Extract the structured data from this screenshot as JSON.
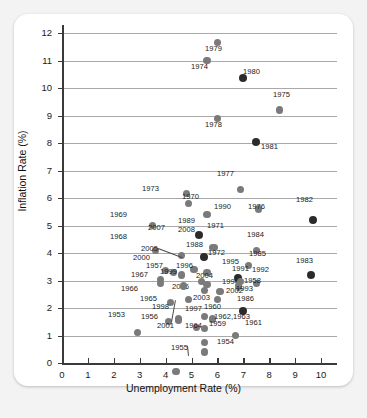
{
  "chart_data": {
    "type": "scatter",
    "title": "",
    "xlabel": "Unemployment Rate (%)",
    "ylabel": "Inflation Rate (%)",
    "xlim": [
      0,
      10.5
    ],
    "ylim": [
      0,
      12.3
    ],
    "xticks": [
      "0",
      "1",
      "2",
      "3",
      "4",
      "5",
      "6",
      "7",
      "8",
      "9",
      "10"
    ],
    "yticks": [
      "0",
      "1",
      "2",
      "3",
      "4",
      "5",
      "6",
      "7",
      "8",
      "9",
      "10",
      "11",
      "12"
    ],
    "grid": "horizontal",
    "legend": "none",
    "point_color": "#7a7a7a",
    "point_color_dark": "#2b2b2b",
    "points": [
      {
        "label": "1979",
        "x": 6.0,
        "y": 11.65,
        "lx": 205,
        "ly": 45,
        "dark": false
      },
      {
        "label": "1974",
        "x": 5.6,
        "y": 11.0,
        "lx": 191,
        "ly": 63,
        "dark": false
      },
      {
        "label": "1980",
        "x": 7.0,
        "y": 10.35,
        "lx": 243,
        "ly": 68,
        "dark": true
      },
      {
        "label": "1975",
        "x": 8.4,
        "y": 9.2,
        "lx": 273,
        "ly": 91,
        "dark": false
      },
      {
        "label": "1978",
        "x": 6.0,
        "y": 8.9,
        "lx": 205,
        "ly": 121,
        "dark": false
      },
      {
        "label": "1981",
        "x": 7.5,
        "y": 8.05,
        "lx": 261,
        "ly": 143,
        "dark": true
      },
      {
        "label": "1977",
        "x": 6.9,
        "y": 6.3,
        "lx": 217,
        "ly": 170,
        "dark": false
      },
      {
        "label": "1973",
        "x": 4.8,
        "y": 6.15,
        "lx": 142,
        "ly": 185,
        "dark": false
      },
      {
        "label": "1970",
        "x": 4.9,
        "y": 5.8,
        "lx": 182,
        "ly": 193,
        "dark": false
      },
      {
        "label": "1990",
        "x": 5.6,
        "y": 5.4,
        "lx": 214,
        "ly": 203,
        "dark": false
      },
      {
        "label": "1976",
        "x": 7.6,
        "y": 5.6,
        "lx": 248,
        "ly": 203,
        "dark": false
      },
      {
        "label": "1982",
        "x": 9.7,
        "y": 5.2,
        "lx": 296,
        "ly": 196,
        "dark": true
      },
      {
        "label": "1969",
        "x": 3.5,
        "y": 5.0,
        "lx": 110,
        "ly": 211,
        "dark": false
      },
      {
        "label": "1989",
        "x": 5.3,
        "y": 4.65,
        "lx": 178,
        "ly": 217,
        "dark": true
      },
      {
        "label": "2008",
        "x": 5.8,
        "y": 4.2,
        "lx": 178,
        "ly": 226,
        "dark": false
      },
      {
        "label": "1971",
        "x": 5.9,
        "y": 4.2,
        "lx": 207,
        "ly": 222,
        "dark": false
      },
      {
        "label": "2007",
        "x": 4.6,
        "y": 3.9,
        "lx": 148,
        "ly": 224,
        "dark": false
      },
      {
        "label": "1968",
        "x": 3.6,
        "y": 4.1,
        "lx": 110,
        "ly": 233,
        "dark": false
      },
      {
        "label": "1984",
        "x": 7.5,
        "y": 4.1,
        "lx": 247,
        "ly": 231,
        "dark": false
      },
      {
        "label": "1988",
        "x": 5.5,
        "y": 3.85,
        "lx": 186,
        "ly": 241,
        "dark": true
      },
      {
        "label": "2005",
        "x": 5.1,
        "y": 3.4,
        "lx": 141,
        "ly": 245,
        "dark": false
      },
      {
        "label": "1972",
        "x": 5.6,
        "y": 3.3,
        "lx": 208,
        "ly": 249,
        "dark": false
      },
      {
        "label": "1985",
        "x": 7.2,
        "y": 3.55,
        "lx": 249,
        "ly": 250,
        "dark": false
      },
      {
        "label": "1983",
        "x": 9.6,
        "y": 3.2,
        "lx": 296,
        "ly": 257,
        "dark": true
      },
      {
        "label": "2000",
        "x": 4.0,
        "y": 3.35,
        "lx": 133,
        "ly": 254,
        "dark": false
      },
      {
        "label": "1995",
        "x": 5.6,
        "y": 2.85,
        "lx": 222,
        "ly": 258,
        "dark": false
      },
      {
        "label": "1957",
        "x": 4.3,
        "y": 3.3,
        "lx": 146,
        "ly": 262,
        "dark": false
      },
      {
        "label": "1996",
        "x": 5.4,
        "y": 2.95,
        "lx": 176,
        "ly": 262,
        "dark": false
      },
      {
        "label": "1991",
        "x": 6.8,
        "y": 3.1,
        "lx": 232,
        "ly": 265,
        "dark": true
      },
      {
        "label": "1967",
        "x": 3.8,
        "y": 3.05,
        "lx": 131,
        "ly": 271,
        "dark": false
      },
      {
        "label": "1999",
        "x": 4.2,
        "y": 2.2,
        "lx": 160,
        "ly": 268,
        "dark": false
      },
      {
        "label": "1992",
        "x": 7.5,
        "y": 2.9,
        "lx": 252,
        "ly": 266,
        "dark": false
      },
      {
        "label": "2004",
        "x": 5.5,
        "y": 2.65,
        "lx": 196,
        "ly": 272,
        "dark": false
      },
      {
        "label": "1966",
        "x": 3.8,
        "y": 2.9,
        "lx": 121,
        "ly": 285,
        "dark": false
      },
      {
        "label": "2006",
        "x": 4.6,
        "y": 3.2,
        "lx": 172,
        "ly": 283,
        "dark": false
      },
      {
        "label": "1994",
        "x": 6.1,
        "y": 2.6,
        "lx": 222,
        "ly": 278,
        "dark": false
      },
      {
        "label": "1958",
        "x": 6.8,
        "y": 2.8,
        "lx": 244,
        "ly": 277,
        "dark": false
      },
      {
        "label": "2002",
        "x": 5.8,
        "y": 1.6,
        "lx": 226,
        "ly": 287,
        "dark": false
      },
      {
        "label": "1993",
        "x": 6.9,
        "y": 2.95,
        "lx": 236,
        "ly": 285,
        "dark": false
      },
      {
        "label": "1965",
        "x": 4.5,
        "y": 1.6,
        "lx": 140,
        "ly": 295,
        "dark": false
      },
      {
        "label": "2003",
        "x": 6.0,
        "y": 2.3,
        "lx": 193,
        "ly": 294,
        "dark": false
      },
      {
        "label": "1986",
        "x": 7.0,
        "y": 1.9,
        "lx": 237,
        "ly": 295,
        "dark": true
      },
      {
        "label": "1998",
        "x": 4.5,
        "y": 1.55,
        "lx": 152,
        "ly": 303,
        "dark": false
      },
      {
        "label": "1997",
        "x": 4.9,
        "y": 2.3,
        "lx": 185,
        "ly": 305,
        "dark": false
      },
      {
        "label": "1960",
        "x": 5.5,
        "y": 1.7,
        "lx": 204,
        "ly": 303,
        "dark": false
      },
      {
        "label": "1953",
        "x": 2.9,
        "y": 1.1,
        "lx": 108,
        "ly": 311,
        "dark": false
      },
      {
        "label": "1956",
        "x": 4.1,
        "y": 1.5,
        "lx": 141,
        "ly": 313,
        "dark": false
      },
      {
        "label": "1962,1963",
        "x": 5.5,
        "y": 1.25,
        "lx": 214,
        "ly": 313,
        "dark": false
      },
      {
        "label": "2001",
        "x": 4.7,
        "y": 2.8,
        "lx": 157,
        "ly": 322,
        "dark": false
      },
      {
        "label": "1964",
        "x": 5.2,
        "y": 1.3,
        "lx": 185,
        "ly": 322,
        "dark": false
      },
      {
        "label": "1959",
        "x": 5.5,
        "y": 0.75,
        "lx": 209,
        "ly": 320,
        "dark": false
      },
      {
        "label": "1961",
        "x": 6.7,
        "y": 1.0,
        "lx": 245,
        "ly": 319,
        "dark": false
      },
      {
        "label": "1955",
        "x": 4.4,
        "y": -0.3,
        "lx": 171,
        "ly": 344,
        "dark": false
      },
      {
        "label": "1954",
        "x": 5.5,
        "y": 0.4,
        "lx": 217,
        "ly": 338,
        "dark": false
      }
    ]
  }
}
